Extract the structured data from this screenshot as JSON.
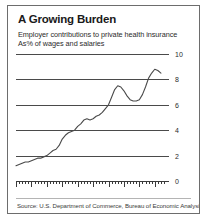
{
  "card": {
    "title": "A Growing Burden",
    "subtitle_line1": "Employer contributions to private health insurance",
    "subtitle_line2": "As% of wages and salaries",
    "source": "Source: U.S. Department of Commerce, Bureau of Economic Analysis",
    "border_color": "#6d6d6d",
    "background_color": "#ffffff"
  },
  "chart_data": {
    "type": "line",
    "title": "A Growing Burden",
    "subtitle": "Employer contributions to private health insurance As% of wages and salaries",
    "xlabel": "",
    "ylabel": "",
    "xlim": [
      1960,
      2008
    ],
    "ylim": [
      0,
      10
    ],
    "grid": true,
    "legend": "none",
    "line_color": "#4a4a4a",
    "ytick_labels": [
      "10",
      "8",
      "6",
      "4",
      "2",
      "0"
    ],
    "ytick_values": [
      10,
      8,
      6,
      4,
      2,
      0
    ],
    "xtick_labels": [
      "1960",
      "65",
      "70",
      "75",
      "80",
      "85",
      "90",
      "95",
      "2000",
      "07"
    ],
    "xtick_values": [
      1960,
      1965,
      1970,
      1975,
      1980,
      1985,
      1990,
      1995,
      2000,
      2007
    ],
    "x": [
      1960,
      1961,
      1962,
      1963,
      1964,
      1965,
      1966,
      1967,
      1968,
      1969,
      1970,
      1971,
      1972,
      1973,
      1974,
      1975,
      1976,
      1977,
      1978,
      1979,
      1980,
      1981,
      1982,
      1983,
      1984,
      1985,
      1986,
      1987,
      1988,
      1989,
      1990,
      1991,
      1992,
      1993,
      1994,
      1995,
      1996,
      1997,
      1998,
      1999,
      2000,
      2001,
      2002,
      2003,
      2004,
      2005,
      2006,
      2007
    ],
    "values": [
      1.2,
      1.3,
      1.4,
      1.5,
      1.5,
      1.6,
      1.7,
      1.8,
      1.8,
      1.9,
      2.0,
      2.2,
      2.4,
      2.5,
      2.8,
      3.3,
      3.6,
      3.8,
      3.9,
      4.0,
      4.3,
      4.5,
      4.8,
      4.9,
      4.8,
      4.9,
      5.1,
      5.2,
      5.4,
      5.7,
      6.0,
      6.6,
      7.2,
      7.5,
      7.4,
      7.1,
      6.7,
      6.4,
      6.3,
      6.3,
      6.4,
      6.8,
      7.4,
      8.1,
      8.5,
      8.8,
      8.7,
      8.5
    ],
    "series_name": "Employer contributions (% of wages and salaries)"
  }
}
